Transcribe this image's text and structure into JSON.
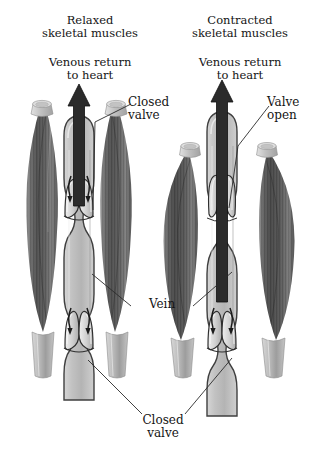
{
  "figure": {
    "panels": [
      {
        "id": "left",
        "heading_line1": "Relaxed",
        "heading_line2": "skeletal muscles",
        "flow_line1": "Venous return",
        "flow_line2": "to heart",
        "muscle_state": "relaxed",
        "upper_valve_state": "closed",
        "lower_valve_state": "closed",
        "blood_flow_direction": "upward to heart",
        "backflow_arrows": "down"
      },
      {
        "id": "right",
        "heading_line1": "Contracted",
        "heading_line2": "skeletal muscles",
        "flow_line1": "Venous return",
        "flow_line2": "to heart",
        "muscle_state": "contracted",
        "upper_valve_state": "open",
        "lower_valve_state": "closed",
        "blood_flow_direction": "upward to heart",
        "backflow_arrows": "down"
      }
    ],
    "callouts": {
      "closed_valve_top_line1": "Closed",
      "closed_valve_top_line2": "valve",
      "valve_open_line1": "Valve",
      "valve_open_line2": "open",
      "vein": "Vein",
      "closed_valve_bottom_line1": "Closed",
      "closed_valve_bottom_line2": "valve"
    },
    "colors": {
      "background": "#ffffff",
      "text": "#141414",
      "muscle_dark": "#4a4a4a",
      "muscle_mid": "#6f6f6f",
      "muscle_light": "#b9b9b9",
      "vein_fill": "#c9c9c9",
      "vein_outline": "#3a3a3a",
      "arrow_dark": "#2b2b2b",
      "leader_line": "#2b2b2b"
    }
  }
}
